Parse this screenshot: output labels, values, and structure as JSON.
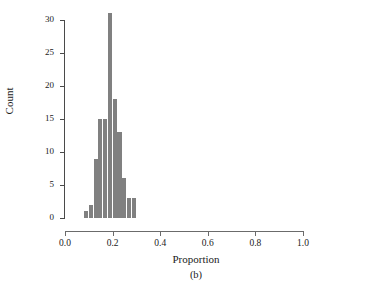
{
  "chart_data": {
    "type": "bar",
    "title": "",
    "subtitle": "",
    "xlabel": "Proportion",
    "ylabel": "Count",
    "panel_label": "(b)",
    "grid": false,
    "legend": null,
    "xlim": [
      0.0,
      1.0
    ],
    "ylim": [
      0,
      30
    ],
    "xticks": [
      0.0,
      0.2,
      0.4,
      0.6,
      0.8,
      1.0
    ],
    "xtick_labels": [
      "0.0",
      "0.2",
      "0.4",
      "0.6",
      "0.8",
      "1.0"
    ],
    "yticks": [
      0,
      5,
      10,
      15,
      20,
      25,
      30
    ],
    "ytick_labels": [
      "0",
      "5",
      "10",
      "15",
      "20",
      "25",
      "30"
    ],
    "bin_width": 0.02,
    "bar_color": "#808080",
    "categories": [
      "0.08",
      "0.10",
      "0.12",
      "0.14",
      "0.16",
      "0.18",
      "0.20",
      "0.22",
      "0.24",
      "0.26",
      "0.28"
    ],
    "bin_edges": [
      0.08,
      0.1,
      0.12,
      0.14,
      0.16,
      0.18,
      0.2,
      0.22,
      0.24,
      0.26,
      0.28,
      0.3
    ],
    "values": [
      1,
      2,
      9,
      15,
      31,
      18,
      13,
      13,
      6,
      3,
      3
    ],
    "bars": [
      {
        "x0": 0.08,
        "x1": 0.1,
        "count": 1
      },
      {
        "x0": 0.1,
        "x1": 0.12,
        "count": 2
      },
      {
        "x0": 0.12,
        "x1": 0.14,
        "count": 9
      },
      {
        "x0": 0.14,
        "x1": 0.16,
        "count": 15
      },
      {
        "x0": 0.16,
        "x1": 0.18,
        "count": 15
      },
      {
        "x0": 0.18,
        "x1": 0.2,
        "count": 31
      },
      {
        "x0": 0.2,
        "x1": 0.22,
        "count": 18
      },
      {
        "x0": 0.22,
        "x1": 0.24,
        "count": 13
      },
      {
        "x0": 0.24,
        "x1": 0.26,
        "count": 6
      },
      {
        "x0": 0.26,
        "x1": 0.28,
        "count": 3
      },
      {
        "x0": 0.28,
        "x1": 0.3,
        "count": 3
      }
    ]
  }
}
